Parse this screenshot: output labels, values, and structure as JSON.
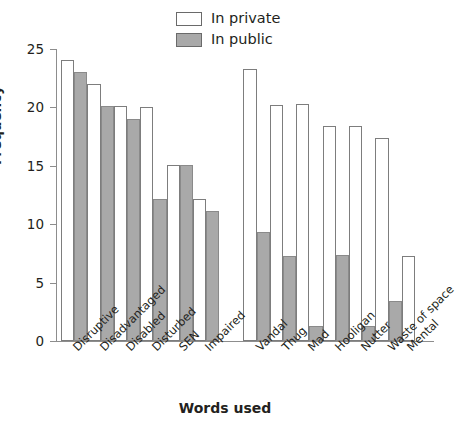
{
  "chart_data": {
    "type": "bar",
    "title": "",
    "xlabel": "Words used",
    "ylabel": "Frequency",
    "ylim": [
      0,
      25
    ],
    "yticks": [
      0,
      5,
      10,
      15,
      20,
      25
    ],
    "grid": false,
    "legend_position": "top-center",
    "categories": [
      "Disruptive",
      "Disadvantaged",
      "Disabled",
      "Disturbed",
      "SEN",
      "Impaired",
      "Vandal",
      "Thug",
      "Mad",
      "Hooligan",
      "Nutter",
      "Waste of space",
      "Mental"
    ],
    "series": [
      {
        "name": "In private",
        "color": "#ffffff",
        "values": [
          24.1,
          22.0,
          20.1,
          20.0,
          15.1,
          12.2,
          23.3,
          20.2,
          20.3,
          18.4,
          18.4,
          17.4,
          7.3
        ]
      },
      {
        "name": "In public",
        "color": "#a9a9a9",
        "values": [
          23.0,
          20.1,
          19.0,
          12.2,
          15.1,
          11.1,
          9.3,
          7.3,
          1.3,
          7.4,
          1.3,
          3.4,
          null
        ]
      }
    ],
    "group_break_after_category_index": 5
  },
  "legend": {
    "entries": [
      {
        "label": "In private",
        "swatch": "white-outlined"
      },
      {
        "label": "In public",
        "swatch": "gray-filled"
      }
    ]
  },
  "axes": {
    "y_title": "Frequency",
    "x_title": "Words used",
    "y_tick_labels": [
      "25",
      "20",
      "15",
      "10",
      "5",
      "0"
    ]
  }
}
